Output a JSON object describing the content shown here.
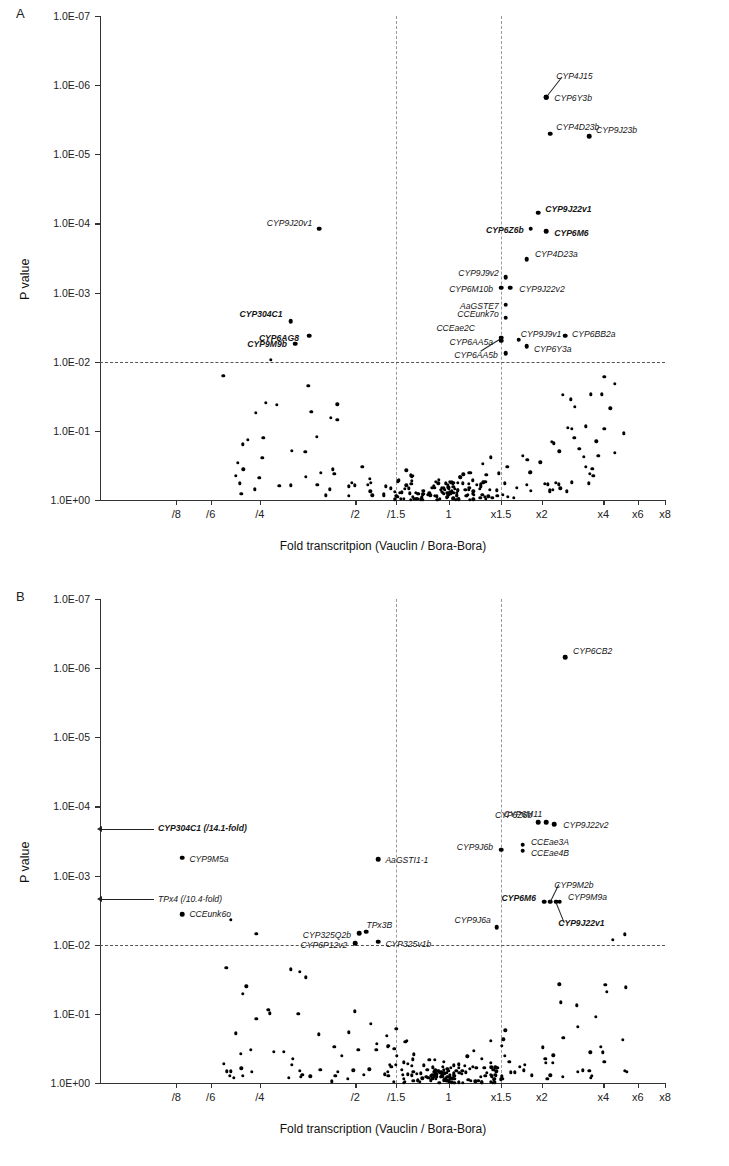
{
  "figure": {
    "panels": [
      {
        "letter": "A",
        "ylabel": "P value",
        "xlabel": "Fold transcritpion  (Vauclin / Bora-Bora)",
        "ytick_labels": [
          "1.0E-07",
          "1.0E-06",
          "1.0E-05",
          "1.0E-04",
          "1.0E-03",
          "1.0E-02",
          "1.0E-01",
          "1.0E+00"
        ],
        "xtick_labels": [
          "/8",
          "/6",
          "/4",
          "/2",
          "/1.5",
          "1",
          "x1.5",
          "x2",
          "x4",
          "x6",
          "x8"
        ]
      },
      {
        "letter": "B",
        "ylabel": "P value",
        "xlabel": "Fold transcription (Vauclin / Bora-Bora)",
        "ytick_labels": [
          "1.0E-07",
          "1.0E-06",
          "1.0E-05",
          "1.0E-04",
          "1.0E-03",
          "1.0E-02",
          "1.0E-01",
          "1.0E+00"
        ],
        "xtick_labels": [
          "/8",
          "/6",
          "/4",
          "/2",
          "/1.5",
          "1",
          "x1.5",
          "x2",
          "x4",
          "x6",
          "x8"
        ]
      }
    ]
  },
  "chart_data": [
    {
      "type": "scatter",
      "panel": "A",
      "title": "",
      "xlabel": "Fold transcritpion  (Vauclin / Bora-Bora)",
      "ylabel": "P value",
      "ylim": [
        1e-07,
        1.0
      ],
      "yscale": "log-inverted",
      "xtick_values": [
        "/8",
        "/6",
        "/4",
        "/2",
        "/1.5",
        "1",
        "x1.5",
        "x2",
        "x4",
        "x6",
        "x8"
      ],
      "grid": false,
      "legend": "none",
      "threshold_lines": {
        "horizontal_p": 0.01,
        "vertical_fold": [
          "/1.5",
          "x1.5"
        ]
      },
      "labeled_points": [
        {
          "label": "CYP4J15",
          "fold": "x2.1",
          "p": 1.5e-06,
          "bold": false,
          "leader": true
        },
        {
          "label": "CYP6Y3b",
          "fold": "x2.1",
          "p": 1.5e-06,
          "bold": false
        },
        {
          "label": "CYP4D23b",
          "fold": "x2.2",
          "p": 5e-06,
          "bold": false
        },
        {
          "label": "CYP9J23b",
          "fold": "x3.4",
          "p": 5.5e-06,
          "bold": false
        },
        {
          "label": "CYP9J20v1",
          "fold": "/2.6",
          "p": 0.00012,
          "bold": false
        },
        {
          "label": "CYP9J22v1",
          "fold": "x1.95",
          "p": 7e-05,
          "bold": true
        },
        {
          "label": "CYP6Z6b",
          "fold": "x1.85",
          "p": 0.00012,
          "bold": true
        },
        {
          "label": "CYP6M6",
          "fold": "x2.1",
          "p": 0.00013,
          "bold": true
        },
        {
          "label": "CYP4D23a",
          "fold": "x1.8",
          "p": 0.00033,
          "bold": false
        },
        {
          "label": "CYP9J9v2",
          "fold": "x1.55",
          "p": 0.0006,
          "bold": false
        },
        {
          "label": "CYP6M10b",
          "fold": "x1.5",
          "p": 0.00085,
          "bold": false
        },
        {
          "label": "CYP9J22v2",
          "fold": "x1.6",
          "p": 0.00085,
          "bold": false
        },
        {
          "label": "AaGSTE7",
          "fold": "x1.55",
          "p": 0.0015,
          "bold": false
        },
        {
          "label": "CCEunk7o",
          "fold": "x1.55",
          "p": 0.0023,
          "bold": false
        },
        {
          "label": "CCEae2C",
          "fold": "x1.5",
          "p": 0.0045,
          "bold": false
        },
        {
          "label": "CYP6AA5a",
          "fold": "x1.5",
          "p": 0.005,
          "bold": false
        },
        {
          "label": "CYP6AA5b",
          "fold": "x1.55",
          "p": 0.0075,
          "bold": false
        },
        {
          "label": "CYP9J9v1",
          "fold": "x1.7",
          "p": 0.0048,
          "bold": false
        },
        {
          "label": "CYP6Y3a",
          "fold": "x1.8",
          "p": 0.006,
          "bold": false
        },
        {
          "label": "CYP6BB2a",
          "fold": "x2.6",
          "p": 0.0042,
          "bold": false
        },
        {
          "label": "CYP304C1",
          "fold": "/3.2",
          "p": 0.0026,
          "bold": true
        },
        {
          "label": "CYP6AG8",
          "fold": "/2.8",
          "p": 0.0042,
          "bold": true
        },
        {
          "label": "CYP9M9b",
          "fold": "/3.1",
          "p": 0.0055,
          "bold": true
        }
      ],
      "unlabeled_point_count": 171
    },
    {
      "type": "scatter",
      "panel": "B",
      "title": "",
      "xlabel": "Fold transcription (Vauclin / Bora-Bora)",
      "ylabel": "P value",
      "ylim": [
        1e-07,
        1.0
      ],
      "yscale": "log-inverted",
      "xtick_values": [
        "/8",
        "/6",
        "/4",
        "/2",
        "/1.5",
        "1",
        "x1.5",
        "x2",
        "x4",
        "x6",
        "x8"
      ],
      "grid": false,
      "legend": "none",
      "threshold_lines": {
        "horizontal_p": 0.01,
        "vertical_fold": [
          "/1.5",
          "x1.5"
        ]
      },
      "labeled_points": [
        {
          "label": "CYP6CB2",
          "fold": "x2.6",
          "p": 7e-07,
          "bold": false
        },
        {
          "label": "CYP6Z6b",
          "fold": "x1.95",
          "p": 0.00017,
          "bold": false
        },
        {
          "label": "CYP6M11",
          "fold": "x2.1",
          "p": 0.00017,
          "bold": false
        },
        {
          "label": "CYP9J22v2",
          "fold": "x2.3",
          "p": 0.00018,
          "bold": false
        },
        {
          "label": "CYP304C1 (/14.1-fold)",
          "fold": "off-scale-left",
          "p": 0.00021,
          "bold": true,
          "arrow": true
        },
        {
          "label": "CYP9M5a",
          "fold": "/7.6",
          "p": 0.00055,
          "bold": false
        },
        {
          "label": "AaGSTI1-1",
          "fold": "/1.7",
          "p": 0.00058,
          "bold": false
        },
        {
          "label": "CYP9J6b",
          "fold": "x1.5",
          "p": 0.00042,
          "bold": false
        },
        {
          "label": "CCEae3A",
          "fold": "x1.75",
          "p": 0.00036,
          "bold": false
        },
        {
          "label": "CCEae4B",
          "fold": "x1.75",
          "p": 0.00044,
          "bold": false
        },
        {
          "label": "TPx4 (/10.4-fold)",
          "fold": "off-scale-left",
          "p": 0.0022,
          "bold": false,
          "arrow": true
        },
        {
          "label": "CCEunk6o",
          "fold": "/7.6",
          "p": 0.0036,
          "bold": false
        },
        {
          "label": "CYP6M6",
          "fold": "x2.05",
          "p": 0.0024,
          "bold": true
        },
        {
          "label": "CYP9M2b",
          "fold": "x2.2",
          "p": 0.0024,
          "bold": false
        },
        {
          "label": "CYP9M9a",
          "fold": "x2.45",
          "p": 0.0024,
          "bold": false
        },
        {
          "label": "CYP9J22v1",
          "fold": "x2.35",
          "p": 0.0024,
          "bold": true
        },
        {
          "label": "CYP325Q2b",
          "fold": "/1.95",
          "p": 0.0068,
          "bold": false
        },
        {
          "label": "TPx3B",
          "fold": "/1.85",
          "p": 0.0065,
          "bold": false
        },
        {
          "label": "CYP6P12v2",
          "fold": "/2.0",
          "p": 0.0095,
          "bold": false
        },
        {
          "label": "CYP325v1b",
          "fold": "/1.7",
          "p": 0.009,
          "bold": false
        },
        {
          "label": "CYP9J6a",
          "fold": "x1.45",
          "p": 0.0056,
          "bold": false
        }
      ],
      "unlabeled_point_count": 183
    }
  ]
}
